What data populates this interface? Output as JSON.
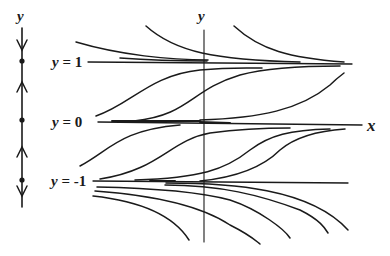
{
  "diagram": {
    "type": "phase-line-and-solution-curves",
    "phase_line": {
      "axis_label": "y",
      "equilibria": [
        1,
        0,
        -1
      ],
      "arrows": [
        {
          "region": "y>1",
          "direction": "down"
        },
        {
          "region": "0<y<1",
          "direction": "up"
        },
        {
          "region": "-1<y<0",
          "direction": "up"
        },
        {
          "region": "y<-1",
          "direction": "down"
        }
      ]
    },
    "equilibrium_labels": [
      {
        "var": "y",
        "eq": "=",
        "value": "1"
      },
      {
        "var": "y",
        "eq": "=",
        "value": "0"
      },
      {
        "var": "y",
        "eq": "=",
        "value": "-1"
      }
    ],
    "axes": {
      "x_label": "x",
      "y_label": "y"
    },
    "colors": {
      "ink": "#1a1a1a",
      "background": "#ffffff"
    }
  }
}
